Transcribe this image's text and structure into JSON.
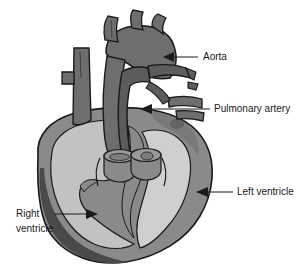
{
  "figure": {
    "background_color": "#ffffff",
    "width": 307,
    "height": 271
  },
  "palette": {
    "background": "#ffffff",
    "outline": "#1a1a1a",
    "vessel_gray": "#6e6e6e",
    "vessel_gray_dark": "#5c5c5c",
    "myocardium_gray": "#8a8a8a",
    "chamber_light": "#c2c2c2",
    "chamber_lighter": "#cfcfcf",
    "shadow_gray": "#4a4a4a",
    "text_color": "#1a1a1a"
  },
  "labels": [
    {
      "id": "aorta",
      "text": "Aorta",
      "text_x": 203,
      "text_y": 57,
      "arrow_direction": "left",
      "anchor_start": "start"
    },
    {
      "id": "pulmonary-artery",
      "text": "Pulmonary artery",
      "text_x": 214,
      "text_y": 109,
      "arrow_direction": "left",
      "anchor_start": "start"
    },
    {
      "id": "left-ventricle",
      "text": "Left ventricle",
      "text_x": 237,
      "text_y": 192,
      "arrow_direction": "left",
      "anchor_start": "start"
    },
    {
      "id": "right-ventricle",
      "text_line_1": "Right",
      "text_line_2": "ventricle",
      "text_x": 16,
      "text_y": 214,
      "arrow_direction": "right",
      "anchor_start": "start"
    }
  ],
  "structures": [
    {
      "id": "aortic-arch",
      "name": "Aortic arch with brachiocephalic branches"
    },
    {
      "id": "superior-vena-cava",
      "name": "Superior vena cava with branch stub"
    },
    {
      "id": "pulmonary-artery-trunk",
      "name": "Pulmonary artery trunk and branches"
    },
    {
      "id": "pulmonary-veins",
      "name": "Pulmonary veins stumps"
    },
    {
      "id": "left-ventricle-cavity",
      "name": "Left ventricle chamber cavity"
    },
    {
      "id": "right-ventricle-cavity",
      "name": "Right ventricle chamber cavity"
    },
    {
      "id": "interventricular-septum",
      "name": "Interventricular septum"
    },
    {
      "id": "myocardium",
      "name": "Myocardial wall"
    },
    {
      "id": "valve-orifices",
      "name": "Cut vessel stumps showing valve orifices"
    }
  ]
}
